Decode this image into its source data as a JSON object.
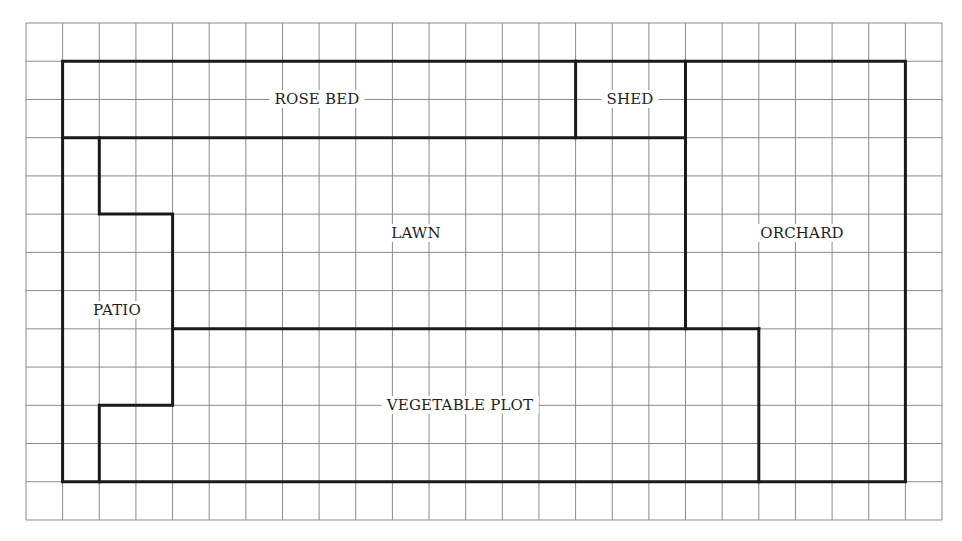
{
  "diagram": {
    "type": "garden-plan-on-grid",
    "grid": {
      "columns": 25,
      "rows": 13,
      "color": "#8a8a8a"
    },
    "outline_color": "#1a1a1a",
    "regions": [
      {
        "id": "rose-bed",
        "label": "ROSE BED",
        "cx": 317,
        "cy": 99
      },
      {
        "id": "shed",
        "label": "SHED",
        "cx": 630,
        "cy": 99
      },
      {
        "id": "lawn",
        "label": "LAWN",
        "cx": 416,
        "cy": 233
      },
      {
        "id": "orchard",
        "label": "ORCHARD",
        "cx": 802,
        "cy": 233
      },
      {
        "id": "patio",
        "label": "PATIO",
        "cx": 117,
        "cy": 310
      },
      {
        "id": "vegetable-plot",
        "label": "VEGETABLE PLOT",
        "cx": 460,
        "cy": 405
      }
    ]
  }
}
